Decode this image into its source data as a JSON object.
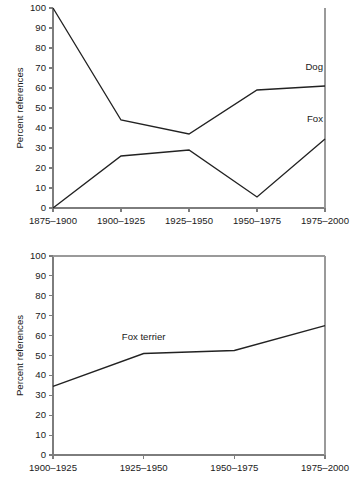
{
  "chart_data": [
    {
      "id": "top",
      "type": "line",
      "title": "",
      "xlabel": "",
      "ylabel": "Percent references",
      "categories": [
        "1875–1900",
        "1900–1925",
        "1925–1950",
        "1950–1975",
        "1975–2000"
      ],
      "ylim": [
        0,
        100
      ],
      "yticks": [
        0,
        10,
        20,
        30,
        40,
        50,
        60,
        70,
        80,
        90,
        100
      ],
      "ytick_labels": [
        "0",
        "10",
        "20",
        "30",
        "40",
        "50",
        "60",
        "70",
        "80",
        "90",
        "100"
      ],
      "grid": false,
      "legend_position": "inline-right",
      "series": [
        {
          "name": "Dog",
          "values": [
            100,
            44,
            37,
            59,
            61
          ]
        },
        {
          "name": "Fox",
          "values": [
            0,
            26,
            29,
            5.5,
            34.5
          ]
        }
      ],
      "annotations": [
        {
          "text": "Dog",
          "x_category": "1975–2000",
          "y": 69
        },
        {
          "text": "Fox",
          "x_category": "1975–2000",
          "y": 43
        }
      ]
    },
    {
      "id": "bottom",
      "type": "line",
      "title": "",
      "xlabel": "",
      "ylabel": "Percent references",
      "categories": [
        "1900–1925",
        "1925–1950",
        "1950–1975",
        "1975–2000"
      ],
      "ylim": [
        0,
        100
      ],
      "yticks": [
        0,
        10,
        20,
        30,
        40,
        50,
        60,
        70,
        80,
        90,
        100
      ],
      "ytick_labels": [
        "0",
        "10",
        "20",
        "30",
        "40",
        "50",
        "60",
        "70",
        "80",
        "90",
        "100"
      ],
      "grid": false,
      "legend_position": "inline-above-line",
      "series": [
        {
          "name": "Fox terrier",
          "values": [
            34.5,
            51,
            52.5,
            65
          ]
        }
      ],
      "annotations": [
        {
          "text": "Fox terrier",
          "x_category": "1925–1950",
          "y": 58
        }
      ]
    }
  ],
  "colors": {
    "series_stroke": "#222222",
    "axis": "#7d7d7d",
    "frame": "#9a9a9a",
    "text": "#1a1a1a",
    "background": "#ffffff"
  }
}
